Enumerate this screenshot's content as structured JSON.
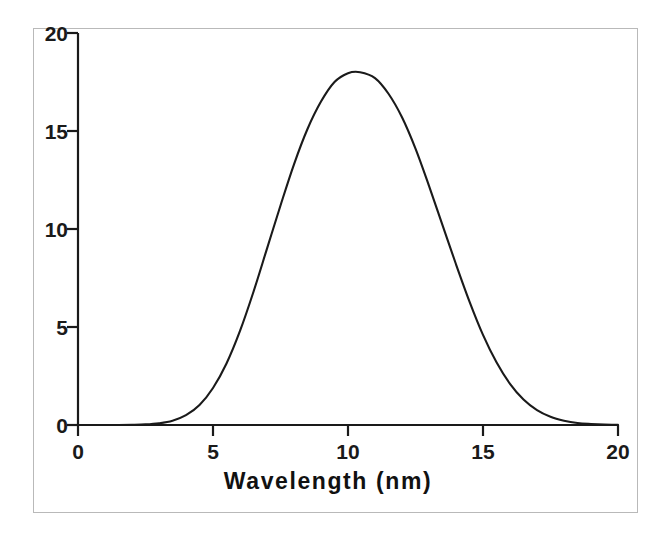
{
  "chart_data": {
    "type": "line",
    "title": "",
    "subtitle": "",
    "xlabel": "Wavelength (nm)",
    "ylabel": "",
    "xlim": [
      0,
      20
    ],
    "ylim": [
      0,
      20
    ],
    "xticks": [
      "0",
      "5",
      "10",
      "15",
      "20"
    ],
    "yticks": [
      "0",
      "5",
      "10",
      "15",
      "20"
    ],
    "xtick_values": [
      0,
      5,
      10,
      15,
      20
    ],
    "ytick_values": [
      0,
      5,
      10,
      15,
      20
    ],
    "grid": false,
    "legend": "none",
    "annotations": [],
    "line_color": "#1a1a1a",
    "frame_color": "#b9b9b9",
    "background_color": "#ffffff",
    "peak": {
      "x": 10.45,
      "y": 18.0
    },
    "fwhm": 4.9,
    "series": [
      {
        "name": "Spectral intensity",
        "x": [
          0.0,
          0.5,
          1.0,
          1.5,
          2.0,
          2.5,
          3.0,
          3.5,
          4.0,
          4.5,
          5.0,
          5.5,
          6.0,
          6.5,
          7.0,
          7.5,
          8.0,
          8.5,
          9.0,
          9.5,
          10.0,
          10.45,
          11.0,
          11.5,
          12.0,
          12.5,
          13.0,
          13.5,
          14.0,
          14.5,
          15.0,
          15.5,
          16.0,
          16.5,
          17.0,
          17.5,
          18.0,
          18.5,
          19.0,
          19.5,
          20.0
        ],
        "y": [
          0.0,
          0.0,
          0.0,
          0.0,
          0.01,
          0.03,
          0.09,
          0.22,
          0.5,
          1.02,
          1.89,
          3.14,
          4.8,
          6.8,
          9.0,
          11.2,
          13.3,
          15.1,
          16.5,
          17.5,
          17.95,
          18.0,
          17.7,
          16.9,
          15.7,
          14.1,
          12.2,
          10.2,
          8.2,
          6.3,
          4.6,
          3.2,
          2.1,
          1.3,
          0.76,
          0.42,
          0.22,
          0.1,
          0.05,
          0.02,
          0.01
        ]
      }
    ]
  },
  "axes": {
    "y_tick_labels": [
      {
        "text": "20",
        "value": 20
      },
      {
        "text": "15",
        "value": 15
      },
      {
        "text": "10",
        "value": 10
      },
      {
        "text": "5",
        "value": 5
      },
      {
        "text": "0",
        "value": 0
      }
    ],
    "x_tick_labels": [
      {
        "text": "0",
        "value": 0
      },
      {
        "text": "5",
        "value": 5
      },
      {
        "text": "10",
        "value": 10
      },
      {
        "text": "15",
        "value": 15
      },
      {
        "text": "20",
        "value": 20
      }
    ],
    "x_title": "Wavelength (nm)"
  }
}
